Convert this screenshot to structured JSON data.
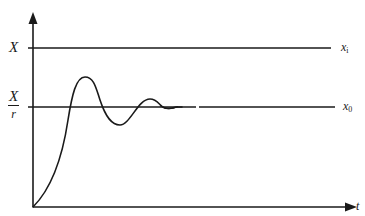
{
  "diagram": {
    "type": "step-response",
    "colors": {
      "ink": "#1a1a1a",
      "background": "#ffffff"
    },
    "axes": {
      "x_label": "t",
      "y_label": "",
      "origin": [
        33,
        207
      ]
    },
    "levels": [
      {
        "id": "input-level",
        "left_label": "X",
        "right_label_base": "x",
        "right_label_sub": "i",
        "y": 48
      },
      {
        "id": "output-level",
        "left_label_num": "X",
        "left_label_den": "r",
        "right_label_base": "x",
        "right_label_sub": "0",
        "y": 107
      }
    ],
    "curve_keypoints": [
      {
        "name": "origin",
        "x": 33,
        "y": 207
      },
      {
        "name": "first-peak",
        "x": 85,
        "y": 77
      },
      {
        "name": "first-trough",
        "x": 120,
        "y": 125
      },
      {
        "name": "second-peak",
        "x": 150,
        "y": 99
      },
      {
        "name": "second-trough",
        "x": 170,
        "y": 108
      },
      {
        "name": "settled",
        "x": 182,
        "y": 107
      }
    ]
  }
}
